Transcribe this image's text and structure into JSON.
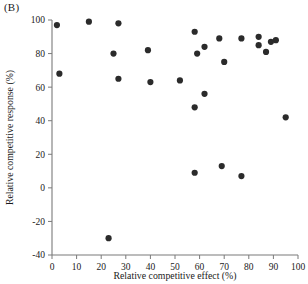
{
  "panel": {
    "label": "(B)"
  },
  "chart_data": {
    "type": "scatter",
    "title": "",
    "xlabel": "Relative competitive effect (%)",
    "ylabel": "Relative competitive response (%)",
    "xlim": [
      0,
      100
    ],
    "ylim": [
      -40,
      100
    ],
    "xticks": [
      0,
      10,
      20,
      30,
      40,
      50,
      60,
      70,
      80,
      90,
      100
    ],
    "yticks": [
      -40,
      -20,
      0,
      20,
      40,
      60,
      80,
      100
    ],
    "xticklabels": [
      "0",
      "10",
      "20",
      "30",
      "40",
      "50",
      "60",
      "70",
      "80",
      "90",
      "100"
    ],
    "yticklabels": [
      "-40",
      "-20",
      "0",
      "20",
      "40",
      "60",
      "80",
      "100"
    ],
    "grid": false,
    "legend": false,
    "marker": "filled-circle",
    "marker_color": "#2b2b2b",
    "marker_size": 3.1,
    "points": [
      {
        "x": 2,
        "y": 97
      },
      {
        "x": 15,
        "y": 99
      },
      {
        "x": 27,
        "y": 98
      },
      {
        "x": 58,
        "y": 93
      },
      {
        "x": 68,
        "y": 89
      },
      {
        "x": 77,
        "y": 89
      },
      {
        "x": 84,
        "y": 90
      },
      {
        "x": 84,
        "y": 85
      },
      {
        "x": 89,
        "y": 87
      },
      {
        "x": 91,
        "y": 88
      },
      {
        "x": 25,
        "y": 80
      },
      {
        "x": 39,
        "y": 82
      },
      {
        "x": 62,
        "y": 84
      },
      {
        "x": 59,
        "y": 80
      },
      {
        "x": 87,
        "y": 81
      },
      {
        "x": 3,
        "y": 68
      },
      {
        "x": 27,
        "y": 65
      },
      {
        "x": 40,
        "y": 63
      },
      {
        "x": 52,
        "y": 64
      },
      {
        "x": 70,
        "y": 75
      },
      {
        "x": 62,
        "y": 56
      },
      {
        "x": 58,
        "y": 48
      },
      {
        "x": 95,
        "y": 42
      },
      {
        "x": 58,
        "y": 9
      },
      {
        "x": 69,
        "y": 13
      },
      {
        "x": 77,
        "y": 7
      },
      {
        "x": 23,
        "y": -30
      }
    ]
  }
}
